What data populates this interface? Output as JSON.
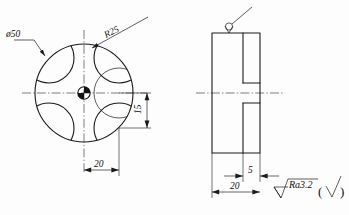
{
  "drawing": {
    "title": "Mechanical part drawing - four-lobed disc",
    "background_color": "#fdfdfd",
    "line_color": "#1a1a1a",
    "views": {
      "front": {
        "name": "front-view-circular",
        "diameter_label": "ø50",
        "radius_label": "R25",
        "dim_vertical": "15",
        "dim_horizontal": "20"
      },
      "side": {
        "name": "side-view-rectangular",
        "dim_slot": "5",
        "dim_width": "20"
      }
    },
    "notes": {
      "roughness_value": "Ra3.2",
      "paren_open": "(",
      "paren_close": ")",
      "surface_symbol": "machining-allowance-symbol"
    }
  }
}
